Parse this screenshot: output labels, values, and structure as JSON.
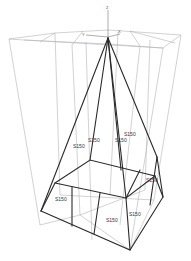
{
  "view": {
    "type": "3D wireframe structural model",
    "background": "#ffffff",
    "member_color": "#2a2a2a",
    "grid_color": "#b4b4b4"
  },
  "axes": {
    "z_label": "Z",
    "x_label": "X",
    "y_label": "Y"
  },
  "member_labels": {
    "left_leg_upper": "S150",
    "center_leg_upper": "S150",
    "right_leg_inner": "S150",
    "right_leg_upper": "S150",
    "left_base": "S150",
    "front_base": "S150",
    "right_base_front": "S150",
    "right_base_back": "S150"
  }
}
